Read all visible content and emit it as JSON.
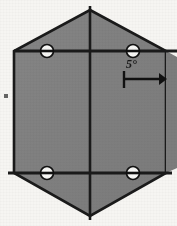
{
  "figure": {
    "background_color": "#f6f5f2",
    "shape": {
      "name": "hexagon-plate",
      "fill_color": "#808080",
      "stroke_color": "#1a1a1a",
      "vertices": [
        {
          "x": 90,
          "y": 10
        },
        {
          "x": 166,
          "y": 51
        },
        {
          "x": 166,
          "y": 173
        },
        {
          "x": 90,
          "y": 216
        },
        {
          "x": 14,
          "y": 173
        },
        {
          "x": 14,
          "y": 51
        }
      ]
    },
    "center_line": {
      "name": "vertical-center-line",
      "x": 90,
      "y1": 6,
      "y2": 220,
      "color": "#1a1a1a"
    },
    "horizontal_lines": [
      {
        "name": "upper-horizontal-line",
        "y": 51,
        "x1": 14,
        "x2": 177,
        "color": "#1a1a1a"
      },
      {
        "name": "lower-horizontal-line",
        "y": 173,
        "x1": 8,
        "x2": 172,
        "color": "#1a1a1a"
      }
    ],
    "markers": [
      {
        "name": "pin-marker-top-left",
        "cx": 47,
        "cy": 51
      },
      {
        "name": "pin-marker-top-right",
        "cx": 133,
        "cy": 51
      },
      {
        "name": "pin-marker-bottom-left",
        "cx": 47,
        "cy": 173
      },
      {
        "name": "pin-marker-bottom-right",
        "cx": 133,
        "cy": 173
      }
    ],
    "marker_style": {
      "radius": 6.5,
      "fill_color": "#f7f7f5",
      "stroke_color": "#111111",
      "bar_color": "#111111"
    },
    "annotation": {
      "label": "5°",
      "arrow": {
        "name": "rotation-arrow",
        "tail_x": 124,
        "tip_x": 167,
        "y": 79,
        "tick_top": 71,
        "tick_bottom": 88,
        "color": "#111111"
      }
    },
    "artifacts": [
      {
        "name": "edge-speck-left",
        "x": 4,
        "y": 94,
        "w": 4,
        "h": 4,
        "color": "#4a4a4a"
      }
    ]
  }
}
